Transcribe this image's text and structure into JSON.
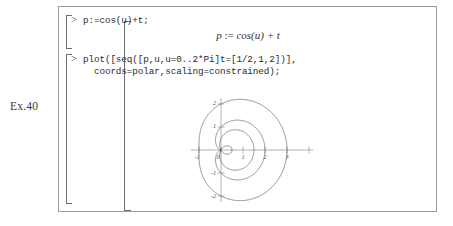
{
  "exercise": {
    "label": "Ex.40"
  },
  "worksheet": {
    "groups": [
      {
        "prompt": ">",
        "code": "p:=cos(u)+t;",
        "output": {
          "lhs": "p",
          "assign": ":=",
          "rhs": "cos(u) + t"
        }
      },
      {
        "prompt": ">",
        "code": "plot([seq([p,u,u=0..2*Pi]t=[1/2,1,2])],\n  coords=polar,scaling=constrained);"
      }
    ]
  },
  "chart_data": {
    "type": "line",
    "title": "",
    "xlabel": "",
    "ylabel": "",
    "coords": "polar",
    "scaling": "constrained",
    "grid": false,
    "legend": "none",
    "xlim": [
      -1.35,
      3.35
    ],
    "ylim": [
      -2.35,
      2.35
    ],
    "xticks": [
      -1,
      0,
      1,
      2,
      3
    ],
    "yticks": [
      2,
      1,
      -1,
      -2
    ],
    "xtick_labels": [
      "-1",
      "0",
      "1",
      "2",
      "3"
    ],
    "ytick_labels": [
      "2",
      "1",
      "-1",
      "-2"
    ],
    "formula": "r = cos(u) + t,  u = 0..2*Pi",
    "series": [
      {
        "name": "t = 1/2",
        "t": 0.5,
        "r_max": 1.5,
        "r_min": -0.5,
        "note": "limacon with inner loop"
      },
      {
        "name": "t = 1",
        "t": 1.0,
        "r_max": 2.0,
        "r_min": 0.0,
        "note": "cardioid"
      },
      {
        "name": "t = 2",
        "t": 2.0,
        "r_max": 3.0,
        "r_min": 1.0,
        "note": "convex limacon"
      }
    ]
  },
  "colors": {
    "frame": "#9b9b9b",
    "bracket": "#6f6f6f",
    "code_text": "#2b2b2b",
    "curve": "#555555",
    "axis": "#777777",
    "background": "#ffffff"
  }
}
